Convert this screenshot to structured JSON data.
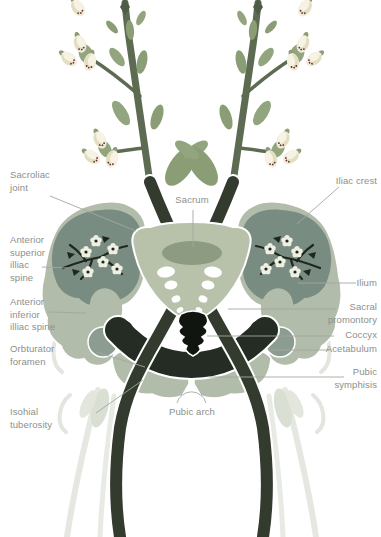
{
  "figure": {
    "type": "anatomical-illustration",
    "background": "#ffffff",
    "palette": {
      "bone_light": "#b2bcaa",
      "bone_mid": "#8c9b82",
      "ilium_fill": "#798c81",
      "stem_dark": "#333b2f",
      "ring_dark": "#242c24",
      "coccyx_dark": "#11150f",
      "stem_olive": "#5d6b52",
      "leaf_green": "#8a9d74",
      "leaf_light": "#93a57e",
      "flower_cream": "#f1ecd9",
      "blossom_white": "#edf0e2",
      "ghost_gray": "#e5e8e1",
      "label_text": "#8b908b",
      "leader_line": "#a2a7a0"
    },
    "labels": {
      "sacroiliac_joint": "Sacroliac\njoint",
      "anterior_superior_iliac_spine": "Anterior\nsuperior\nilliac\nspine",
      "anterior_inferior_iliac_spine": "Anterior\ninferior\nilliac spine",
      "obturator_foramen": "Orbturator\nforamen",
      "ischial_tuberosity": "Isohial\ntuberosity",
      "sacrum": "Sacrum",
      "pubic_arch": "Pubic arch",
      "iliac_crest": "Iliac crest",
      "ilium": "Ilium",
      "sacral_promontory": "Sacral\npromontory",
      "coccyx": "Coccyx",
      "acetabulum": "Acetabulum",
      "pubic_symphysis": "Pubic\nsymphisis"
    }
  }
}
